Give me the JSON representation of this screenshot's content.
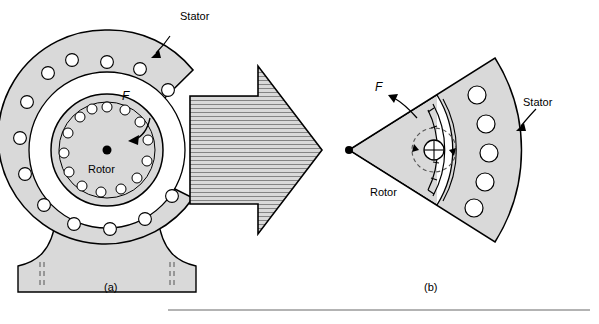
{
  "figure": {
    "title": "",
    "panels": [
      {
        "id": "a",
        "caption": "(a)",
        "labels": {
          "stator": "Stator",
          "rotor": "Rotor",
          "force": "F"
        }
      },
      {
        "id": "b",
        "caption": "(b)",
        "labels": {
          "stator": "Stator",
          "rotor": "Rotor",
          "force": "F"
        }
      }
    ],
    "colors": {
      "fill_light": "#d9d9d9",
      "fill_mid": "#c8c8c8",
      "fill_white": "#ffffff",
      "stroke": "#000000",
      "rule": "#808080"
    }
  }
}
